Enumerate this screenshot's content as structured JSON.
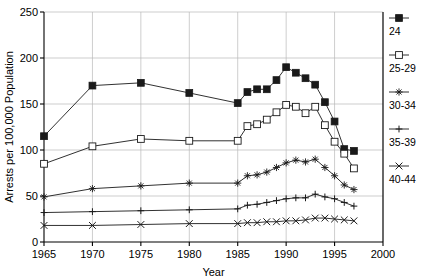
{
  "chart_data": {
    "type": "line",
    "title": "",
    "xlabel": "Year",
    "ylabel": "Arrests per 100,000 Population",
    "xlim": [
      1965,
      2000
    ],
    "ylim": [
      0,
      250
    ],
    "xticks": [
      1965,
      1970,
      1975,
      1980,
      1985,
      1990,
      1995,
      2000
    ],
    "yticks": [
      0,
      50,
      100,
      150,
      200,
      250
    ],
    "grid": true,
    "legend_position": "right",
    "series": [
      {
        "name": "24",
        "marker": "filled-square",
        "x": [
          1965,
          1970,
          1975,
          1980,
          1985,
          1986,
          1987,
          1988,
          1989,
          1990,
          1991,
          1992,
          1993,
          1994,
          1995,
          1996,
          1997
        ],
        "values": [
          115,
          170,
          173,
          162,
          151,
          163,
          166,
          166,
          176,
          190,
          184,
          178,
          171,
          152,
          131,
          101,
          99
        ]
      },
      {
        "name": "25-29",
        "marker": "open-square",
        "x": [
          1965,
          1970,
          1975,
          1980,
          1985,
          1986,
          1987,
          1988,
          1989,
          1990,
          1991,
          1992,
          1993,
          1994,
          1995,
          1996,
          1997
        ],
        "values": [
          85,
          104,
          112,
          110,
          110,
          126,
          128,
          133,
          141,
          149,
          147,
          140,
          147,
          127,
          109,
          96,
          80
        ]
      },
      {
        "name": "30-34",
        "marker": "asterisk",
        "x": [
          1965,
          1970,
          1975,
          1980,
          1985,
          1986,
          1987,
          1988,
          1989,
          1990,
          1991,
          1992,
          1993,
          1994,
          1995,
          1996,
          1997
        ],
        "values": [
          49,
          58,
          61,
          64,
          64,
          72,
          73,
          76,
          81,
          86,
          89,
          87,
          90,
          81,
          72,
          62,
          57
        ]
      },
      {
        "name": "35-39",
        "marker": "plus",
        "x": [
          1965,
          1970,
          1975,
          1980,
          1985,
          1986,
          1987,
          1988,
          1989,
          1990,
          1991,
          1992,
          1993,
          1994,
          1995,
          1996,
          1997
        ],
        "values": [
          32,
          33,
          34,
          35,
          36,
          40,
          41,
          43,
          45,
          47,
          48,
          48,
          52,
          49,
          47,
          43,
          39
        ]
      },
      {
        "name": "40-44",
        "marker": "cross",
        "x": [
          1965,
          1970,
          1975,
          1980,
          1985,
          1986,
          1987,
          1988,
          1989,
          1990,
          1991,
          1992,
          1993,
          1994,
          1995,
          1996,
          1997
        ],
        "values": [
          18,
          18,
          19,
          20,
          20,
          21,
          21,
          22,
          22,
          23,
          23,
          24,
          26,
          26,
          25,
          24,
          23
        ]
      }
    ]
  },
  "legend": {
    "items": [
      {
        "label": "24",
        "marker": "filled-square"
      },
      {
        "label": "25-29",
        "marker": "open-square"
      },
      {
        "label": "30-34",
        "marker": "asterisk"
      },
      {
        "label": "35-39",
        "marker": "plus"
      },
      {
        "label": "40-44",
        "marker": "cross"
      }
    ]
  },
  "colors": {
    "ink": "#1a1a1a",
    "grid": "#b8b8b8",
    "background": "#ffffff"
  }
}
